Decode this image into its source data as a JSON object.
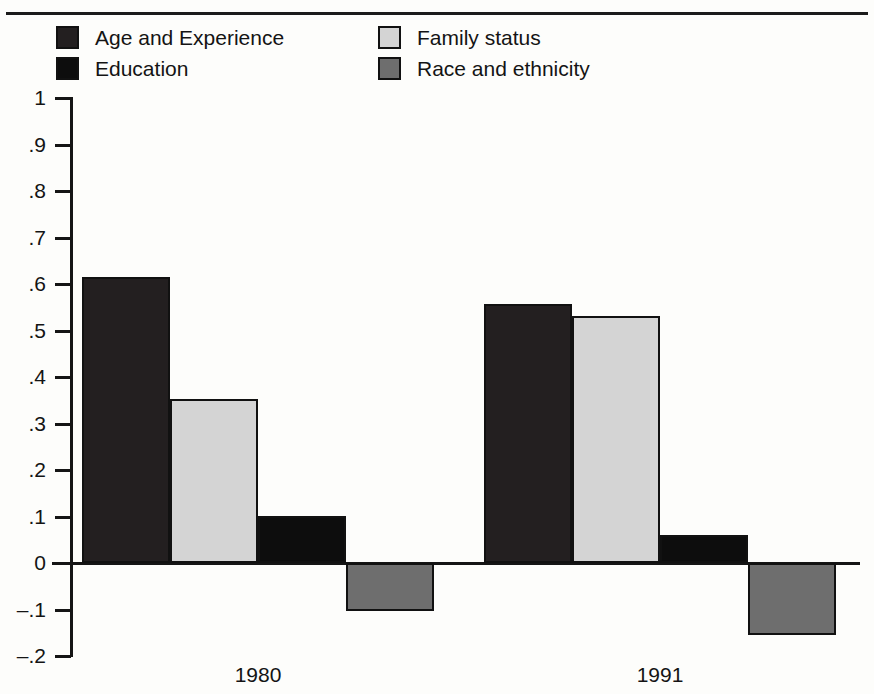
{
  "chart_data": {
    "type": "bar",
    "title": "",
    "xlabel": "",
    "ylabel": "",
    "categories": [
      "1980",
      "1991"
    ],
    "series": [
      {
        "name": "Age and Experience",
        "color": "#231f20",
        "values": [
          0.615,
          0.557
        ]
      },
      {
        "name": "Family status",
        "color": "#d4d4d4",
        "values": [
          0.352,
          0.531
        ]
      },
      {
        "name": "Education",
        "color": "#0d0d0d",
        "values": [
          0.101,
          0.061
        ]
      },
      {
        "name": "Race and ethnicity",
        "color": "#6e6e6e",
        "values": [
          -0.104,
          -0.155
        ]
      }
    ],
    "ylim": [
      -0.2,
      1.0
    ],
    "ytick_values": [
      1,
      0.9,
      0.8,
      0.7,
      0.6,
      0.5,
      0.4,
      0.3,
      0.2,
      0.1,
      0,
      -0.1,
      -0.2
    ],
    "ytick_labels": [
      "1",
      ".9",
      ".8",
      ".7",
      ".6",
      ".5",
      ".4",
      ".3",
      ".2",
      ".1",
      "0",
      "–.1",
      "–.2"
    ],
    "grid": false,
    "legend_position": "top-left",
    "legend": [
      {
        "label": "Age and Experience",
        "color": "#231f20"
      },
      {
        "label": "Education",
        "color": "#0d0d0d"
      },
      {
        "label": "Family status",
        "color": "#d4d4d4"
      },
      {
        "label": "Race and ethnicity",
        "color": "#6e6e6e"
      }
    ]
  },
  "figure": {
    "background": "#fdfdfb",
    "axis_color": "#151515",
    "bar_edge_color": "#111111"
  }
}
